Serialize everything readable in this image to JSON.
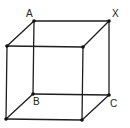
{
  "diagram": {
    "type": "cube-wireframe",
    "labels": {
      "A": "A",
      "X": "X",
      "B": "B",
      "C": "C"
    },
    "vertices": {
      "back_top_left": {
        "x": 34,
        "y": 21,
        "label": "A"
      },
      "back_top_right": {
        "x": 109,
        "y": 21,
        "label": "X"
      },
      "back_bottom_left": {
        "x": 33,
        "y": 94,
        "label": "B"
      },
      "back_bottom_right": {
        "x": 109,
        "y": 95,
        "label": "C"
      },
      "front_top_left": {
        "x": 7,
        "y": 46
      },
      "front_top_right": {
        "x": 83,
        "y": 47
      },
      "front_bottom_left": {
        "x": 6,
        "y": 119
      },
      "front_bottom_right": {
        "x": 82,
        "y": 120
      }
    },
    "colors": {
      "line": "#1e1e1e",
      "vertex": "#111111",
      "background": "#ffffff"
    }
  }
}
